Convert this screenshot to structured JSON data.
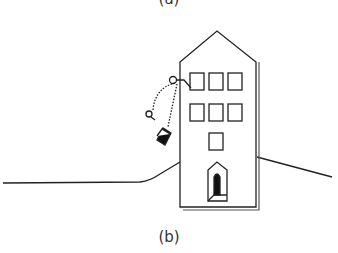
{
  "figure": {
    "top_label": "(a)",
    "bottom_label": "(b)",
    "colors": {
      "stroke": "#222222",
      "background": "#ffffff"
    }
  }
}
